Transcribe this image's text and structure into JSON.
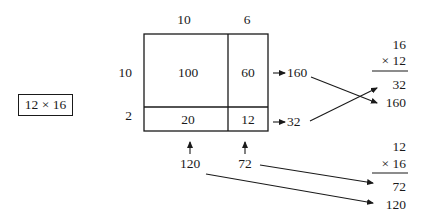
{
  "problem": {
    "expression": "12 × 16"
  },
  "area_model": {
    "column_headers": [
      "10",
      "6"
    ],
    "row_headers": [
      "10",
      "2"
    ],
    "cells": [
      [
        "100",
        "60"
      ],
      [
        "20",
        "12"
      ]
    ],
    "row_sums": [
      "160",
      "32"
    ],
    "column_sums": [
      "120",
      "72"
    ]
  },
  "algorithm_a": {
    "multiplicand": "16",
    "multiplier": "× 12",
    "partials": [
      "32",
      "160"
    ]
  },
  "algorithm_b": {
    "multiplicand": "12",
    "multiplier": "× 16",
    "partials": [
      "72",
      "120"
    ]
  },
  "colors": {
    "ink": "#1a1a1a",
    "background": "#ffffff"
  }
}
